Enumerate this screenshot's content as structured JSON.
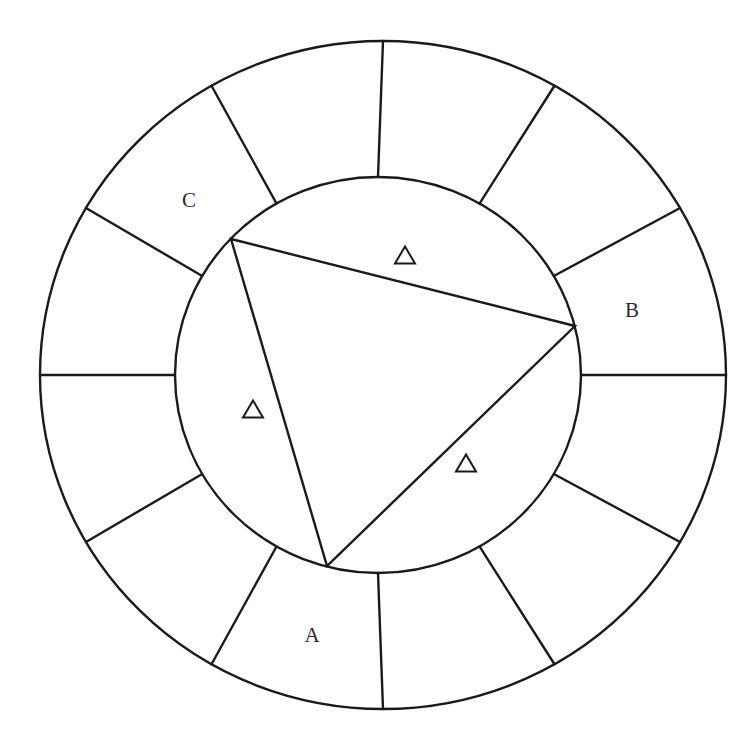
{
  "diagram": {
    "title": "",
    "outer_circle": {
      "cx": 383,
      "cy": 375,
      "rx": 343,
      "ry": 334
    },
    "inner_circle": {
      "cx": 378,
      "cy": 375,
      "rx": 203,
      "ry": 198
    },
    "spoke_count": 12,
    "spoke_start_deg": 0,
    "triangle": {
      "vertices": [
        [
          231,
          239
        ],
        [
          575,
          326
        ],
        [
          327,
          566
        ]
      ]
    },
    "labels": [
      {
        "text": "C",
        "x": 189,
        "y": 207
      },
      {
        "text": "B",
        "x": 632,
        "y": 317
      },
      {
        "text": "A",
        "x": 312,
        "y": 642
      }
    ],
    "triangle_markers": [
      {
        "symbol": "△",
        "x": 405,
        "y": 256
      },
      {
        "symbol": "△",
        "x": 253,
        "y": 410
      },
      {
        "symbol": "△",
        "x": 466,
        "y": 464
      }
    ],
    "colors": {
      "line": "#1a1a1a",
      "text": "#2a2a2a",
      "background": "#ffffff"
    }
  }
}
